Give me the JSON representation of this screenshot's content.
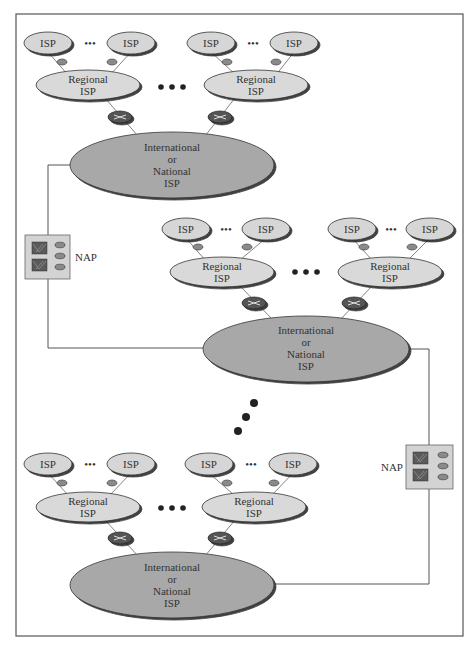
{
  "diagram": {
    "colors": {
      "frame": "#555555",
      "isp_fill": "#d6d6d6",
      "regional_fill": "#d9d9d9",
      "national_fill": "#a8a8a8",
      "router_small": "#8a8a8a",
      "router_large": "#555555",
      "nap_fill": "#d3d3d3",
      "nap_switch": "#5a5a5a",
      "line": "#555555"
    },
    "labels": {
      "isp": "ISP",
      "regional_line1": "Regional",
      "regional_line2": "ISP",
      "national_line1": "International",
      "national_line2": "or",
      "national_line3": "National",
      "national_line4": "ISP",
      "nap": "NAP",
      "ellipsis_small": "•••",
      "ellipsis_large": "● ● ●"
    },
    "tiers": [
      {
        "name": "top",
        "national_center": [
          172,
          165
        ],
        "regional_centers": [
          [
            88,
            85
          ],
          [
            256,
            85
          ]
        ],
        "isp_centers": [
          [
            48,
            43
          ],
          [
            131,
            43
          ],
          [
            211,
            43
          ],
          [
            294,
            43
          ]
        ]
      },
      {
        "name": "middle",
        "national_center": [
          306,
          349
        ],
        "regional_centers": [
          [
            222,
            272
          ],
          [
            390,
            272
          ]
        ],
        "isp_centers": [
          [
            186,
            229
          ],
          [
            266,
            229
          ],
          [
            352,
            229
          ],
          [
            430,
            229
          ]
        ]
      },
      {
        "name": "bottom",
        "national_center": [
          172,
          585
        ],
        "regional_centers": [
          [
            88,
            507
          ],
          [
            254,
            507
          ]
        ],
        "isp_centers": [
          [
            48,
            464
          ],
          [
            131,
            464
          ],
          [
            209,
            464
          ],
          [
            293,
            464
          ]
        ]
      }
    ],
    "naps": [
      {
        "name": "NAP-left",
        "label": "NAP",
        "box": [
          25,
          235,
          45,
          44
        ]
      },
      {
        "name": "NAP-right",
        "label": "NAP",
        "box": [
          406,
          445,
          47,
          44
        ]
      }
    ]
  }
}
